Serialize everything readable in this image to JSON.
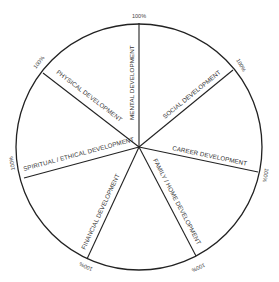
{
  "diagram": {
    "type": "wheel-of-life",
    "center": [
      139,
      147
    ],
    "radius": 123,
    "spokes": [
      {
        "label": "MENTAL DEVELOPMENT",
        "percent": "100%",
        "end": [
          139,
          23
        ]
      },
      {
        "label": "SOCIAL DEVELOPMENT",
        "percent": "100%",
        "end": [
          233,
          70
        ]
      },
      {
        "label": "CAREER DEVELOPMENT",
        "percent": "100%",
        "end": [
          258,
          172
        ]
      },
      {
        "label": "FAMILY / HOME DEVELOPMENT",
        "percent": "100%",
        "end": [
          196,
          256
        ]
      },
      {
        "label": "FINANCIAL DEVELOPMENT",
        "percent": "100%",
        "end": [
          87,
          259
        ]
      },
      {
        "label": "SPIRITUAL / ETHICAL DEVELOPMENT",
        "percent": "100%",
        "end": [
          24,
          178
        ]
      },
      {
        "label": "PHYSICAL DEVELOPMENT",
        "percent": "100%",
        "end": [
          43,
          73
        ]
      }
    ]
  }
}
